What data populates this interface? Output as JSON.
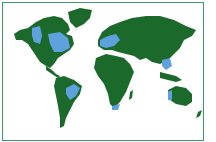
{
  "map": {
    "type": "world-map",
    "title": "World map with highlighted regions",
    "colors": {
      "land": "#1b6a2c",
      "highlight": "#5ea1dc",
      "background": "#ffffff",
      "frame": "#3f9a6a"
    },
    "highlighted_regions": [
      "Western North America",
      "Eastern North America",
      "Europe",
      "Eastern China",
      "Brazil",
      "Southern Africa",
      "Western Australia"
    ]
  }
}
